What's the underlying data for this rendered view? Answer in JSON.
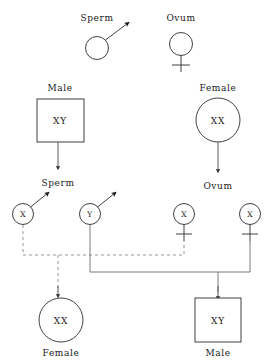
{
  "diagram": {
    "colors": {
      "symbol_stroke": "#2b2b2b",
      "solid_connector": "#6b6b6b",
      "dashed_connector": "#8a8a8a",
      "arrow": "#4a4a4a",
      "background": "#ffffff",
      "text": "#1a1a1a"
    },
    "legend": {
      "sperm_label": "Sperm",
      "ovum_label": "Ovum",
      "sperm_icon": "sperm-circle-with-tail-icon",
      "ovum_icon": "ovum-circle-with-cross-icon"
    },
    "parents": [
      {
        "id": "parent-male",
        "label": "Male",
        "genotype": "XY",
        "shape": "square",
        "gamete_label": "Sperm"
      },
      {
        "id": "parent-female",
        "label": "Female",
        "genotype": "XX",
        "shape": "circle",
        "gamete_label": "Ovum"
      }
    ],
    "gametes": [
      {
        "id": "gamete-sperm-x",
        "allele": "X",
        "type": "sperm"
      },
      {
        "id": "gamete-sperm-y",
        "allele": "Y",
        "type": "sperm"
      },
      {
        "id": "gamete-ovum-x1",
        "allele": "X",
        "type": "ovum"
      },
      {
        "id": "gamete-ovum-x2",
        "allele": "X",
        "type": "ovum"
      }
    ],
    "offspring": [
      {
        "id": "offspring-female",
        "label": "Female",
        "genotype": "XX",
        "shape": "circle",
        "connector": "dashed"
      },
      {
        "id": "offspring-male",
        "label": "Male",
        "genotype": "XY",
        "shape": "square",
        "connector": "solid"
      }
    ]
  }
}
